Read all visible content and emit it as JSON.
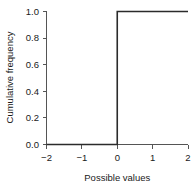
{
  "chart_data": {
    "type": "line",
    "title": "",
    "subtitle": "",
    "xlabel": "Possible values",
    "ylabel": "Cumulative frequency",
    "xlim": [
      -2,
      2
    ],
    "ylim": [
      0.0,
      1.0
    ],
    "grid": false,
    "legend": "none",
    "annotations": [],
    "xticks": [
      -2,
      -1,
      0,
      1,
      2
    ],
    "xtick_labels": [
      "−2",
      "−1",
      "0",
      "1",
      "2"
    ],
    "yticks": [
      0.0,
      0.2,
      0.4,
      0.6,
      0.8,
      1.0
    ],
    "ytick_labels": [
      "0.0",
      "0.2",
      "0.4",
      "0.6",
      "0.8",
      "1.0"
    ],
    "series": [
      {
        "name": "Cumulative frequency",
        "style": "step",
        "color": "#2b2b2b",
        "x": [
          -2,
          0,
          0,
          2
        ],
        "y": [
          0.0,
          0.0,
          1.0,
          1.0
        ]
      }
    ]
  }
}
